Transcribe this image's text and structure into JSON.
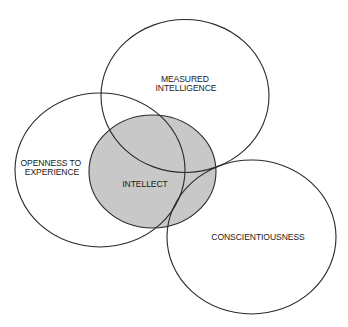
{
  "diagram": {
    "type": "venn",
    "background_color": "#ffffff",
    "shaded_fill_color": "#c8c8c8",
    "stroke_color": "#2a2a2a",
    "sets": [
      {
        "id": "measured-intelligence",
        "label_lines": [
          "MEASURED",
          "INTELLIGENCE"
        ],
        "shaded": false
      },
      {
        "id": "openness-to-experience",
        "label_lines": [
          "OPENNESS TO",
          "EXPERIENCE"
        ],
        "shaded": false
      },
      {
        "id": "intellect",
        "label_lines": [
          "INTELLECT"
        ],
        "shaded": true
      },
      {
        "id": "conscientiousness",
        "label_lines": [
          "CONSCIENTIOUSNESS"
        ],
        "shaded": false
      }
    ]
  }
}
